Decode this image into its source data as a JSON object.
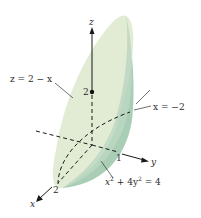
{
  "diagram": {
    "type": "3d-solid-region",
    "colors": {
      "top_surface": "#e2ebd3",
      "side_surface": "#a9cdb5",
      "side_shadow": "#8fbea1",
      "axis": "#1a1a1a",
      "text": "#2a2a2a"
    },
    "axes": {
      "z": {
        "label": "z"
      },
      "y": {
        "label": "y",
        "tick": "1"
      },
      "x": {
        "label": "x",
        "tick": "2"
      }
    },
    "z_intercept": {
      "label": "2"
    },
    "labels": {
      "plane": "z = 2 − x",
      "boundary_plane": "x = −2",
      "cylinder_lhs_x": "x",
      "cylinder_sup1": "2",
      "cylinder_mid": " + 4y",
      "cylinder_sup2": "2",
      "cylinder_rhs": " = 4"
    }
  }
}
